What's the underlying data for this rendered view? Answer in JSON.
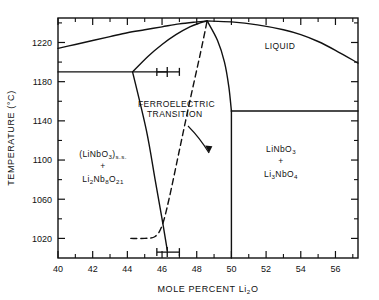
{
  "chart_data": {
    "type": "line",
    "title": "",
    "xlabel": "MOLE PERCENT Li2O",
    "ylabel": "TEMPERATURE (°C)",
    "xlim": [
      40,
      57.3
    ],
    "ylim": [
      1000,
      1245
    ],
    "grid": false,
    "legend_position": "none",
    "x_ticks_major": [
      40,
      42,
      44,
      46,
      48,
      50,
      52,
      54,
      56
    ],
    "x_tick_labels": [
      "40",
      "42",
      "44",
      "46",
      "48",
      "50",
      "52",
      "54",
      "56"
    ],
    "x_ticks_minor": [
      41,
      43,
      45,
      47,
      49,
      51,
      53,
      55,
      57
    ],
    "y_ticks_major": [
      1020,
      1060,
      1100,
      1140,
      1180,
      1220
    ],
    "y_tick_labels": [
      "1020",
      "1060",
      "1100",
      "1140",
      "1180",
      "1220"
    ],
    "y_ticks_minor": [
      1040,
      1080,
      1120,
      1160,
      1200,
      1240
    ],
    "series": [
      {
        "name": "liquidus-left",
        "style": "solid",
        "points": [
          [
            40,
            1214
          ],
          [
            41,
            1218
          ],
          [
            42,
            1222
          ],
          [
            43,
            1226
          ],
          [
            44,
            1230
          ],
          [
            45,
            1233
          ],
          [
            46,
            1236
          ],
          [
            47,
            1239
          ],
          [
            48,
            1241
          ],
          [
            48.6,
            1242
          ]
        ]
      },
      {
        "name": "liquidus-right",
        "style": "solid",
        "points": [
          [
            48.6,
            1242
          ],
          [
            50,
            1241
          ],
          [
            51.5,
            1238
          ],
          [
            53,
            1233
          ],
          [
            54,
            1228
          ],
          [
            55,
            1221
          ],
          [
            56,
            1212
          ],
          [
            57.3,
            1199
          ]
        ]
      },
      {
        "name": "solidus-left",
        "style": "solid",
        "points": [
          [
            44.3,
            1190
          ],
          [
            45.2,
            1206
          ],
          [
            46,
            1218
          ],
          [
            46.8,
            1228
          ],
          [
            47.6,
            1236
          ],
          [
            48.2,
            1240
          ],
          [
            48.6,
            1242
          ]
        ]
      },
      {
        "name": "solidus-right-descending",
        "style": "solid",
        "points": [
          [
            48.6,
            1242
          ],
          [
            49.2,
            1222
          ],
          [
            49.6,
            1200
          ],
          [
            49.85,
            1175
          ],
          [
            50,
            1150
          ]
        ]
      },
      {
        "name": "solid-solution-boundary",
        "style": "solid",
        "points": [
          [
            44.3,
            1190
          ],
          [
            45.1,
            1130
          ],
          [
            45.6,
            1080
          ],
          [
            46,
            1040
          ],
          [
            46.3,
            1008
          ]
        ]
      },
      {
        "name": "stoichiometric-line-50",
        "style": "solid",
        "points": [
          [
            50,
            1150
          ],
          [
            50,
            1000
          ]
        ]
      },
      {
        "name": "eutectic-left-1190",
        "style": "solid",
        "points": [
          [
            40,
            1190
          ],
          [
            46.3,
            1190
          ]
        ]
      },
      {
        "name": "eutectic-right-1150",
        "style": "solid",
        "points": [
          [
            50,
            1150
          ],
          [
            57.3,
            1150
          ]
        ]
      },
      {
        "name": "ferroelectric-transition",
        "style": "dashed",
        "points": [
          [
            44.2,
            1020
          ],
          [
            45,
            1020
          ],
          [
            45.6,
            1022
          ],
          [
            46,
            1033
          ],
          [
            46.4,
            1060
          ],
          [
            47,
            1110
          ],
          [
            47.6,
            1160
          ],
          [
            48.2,
            1208
          ],
          [
            48.6,
            1242
          ]
        ]
      }
    ],
    "error_bars": [
      {
        "name": "upper-composition-error-bar",
        "x": 46.3,
        "y": 1190,
        "x_minus": 45.7,
        "x_plus": 47.0
      },
      {
        "name": "lower-composition-error-bar",
        "x": 46.3,
        "y": 1006,
        "x_minus": 45.7,
        "x_plus": 47.0
      }
    ],
    "region_labels": [
      {
        "name": "liquid",
        "text": "LIQUID",
        "x": 53.2,
        "y": 1227
      },
      {
        "name": "left-two-phase",
        "lines": [
          "(LiNbO3)s.s.",
          "+",
          "Li2Nb8O21"
        ],
        "x": 42.6,
        "y": 1105
      },
      {
        "name": "right-two-phase",
        "lines": [
          "LiNbO3",
          "+",
          "Li3NbO4"
        ],
        "x": 53.0,
        "y": 1118
      }
    ],
    "annotations": [
      {
        "name": "ferroelectric-transition-label",
        "lines": [
          "FERROELECTRIC",
          "TRANSITION"
        ],
        "x": 45.6,
        "y": 1166,
        "arrow_from": [
          47.2,
          1145
        ],
        "arrow_to": [
          48.2,
          1106
        ]
      }
    ]
  },
  "labels": {
    "liquid": "LIQUID",
    "ferro_line1": "FERROELECTRIC",
    "ferro_line2": "TRANSITION",
    "left_l1_a": "(LiNbO",
    "left_l1_sub": "3",
    "left_l1_b": ")",
    "left_l1_ss": "s.s.",
    "plus": "+",
    "left_l3_a": "Li",
    "left_l3_s1": "2",
    "left_l3_b": "Nb",
    "left_l3_s2": "8",
    "left_l3_c": "O",
    "left_l3_s3": "21",
    "right_l1_a": "LiNbO",
    "right_l1_s": "3",
    "right_l3_a": "Li",
    "right_l3_s1": "3",
    "right_l3_b": "NbO",
    "right_l3_s2": "4",
    "x_title_a": "MOLE  PERCENT  Li",
    "x_title_sub": "2",
    "x_title_b": "O",
    "y_title": "TEMPERATURE  (°C)"
  },
  "colors": {
    "ink": "#111111",
    "background": "#ffffff"
  }
}
